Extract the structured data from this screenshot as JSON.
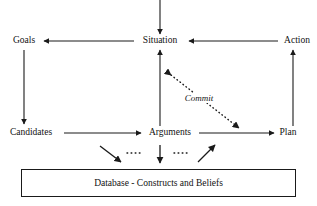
{
  "diagram": {
    "background_color": "#ffffff",
    "line_color": "#1a1a1a",
    "text_color": "#111111",
    "nodes": [
      {
        "id": "goals",
        "label": "Goals",
        "x": 24,
        "y": 41
      },
      {
        "id": "situation",
        "label": "Situation",
        "x": 160,
        "y": 41
      },
      {
        "id": "action",
        "label": "Action",
        "x": 297,
        "y": 41
      },
      {
        "id": "candidates",
        "label": "Candidates",
        "x": 31,
        "y": 133
      },
      {
        "id": "arguments",
        "label": "Arguments",
        "x": 170,
        "y": 133
      },
      {
        "id": "plan",
        "label": "Plan",
        "x": 288,
        "y": 133
      }
    ],
    "edge_labels": [
      {
        "id": "commit",
        "label": "Commit",
        "x": 199,
        "y": 99
      }
    ],
    "database_box": {
      "label": "Database - Constructs and Beliefs"
    },
    "edges": [
      {
        "id": "input-to-situation",
        "from": "top-edge",
        "to": "situation",
        "style": "solid",
        "arrow": "end"
      },
      {
        "id": "situation-to-goals",
        "from": "situation",
        "to": "goals",
        "style": "solid",
        "arrow": "end"
      },
      {
        "id": "action-to-situation",
        "from": "action",
        "to": "situation",
        "style": "solid",
        "arrow": "end"
      },
      {
        "id": "goals-to-candidates",
        "from": "goals",
        "to": "candidates",
        "style": "solid",
        "arrow": "end"
      },
      {
        "id": "arguments-to-situation",
        "from": "arguments",
        "to": "situation",
        "style": "solid",
        "arrow": "end"
      },
      {
        "id": "plan-to-action",
        "from": "plan",
        "to": "action",
        "style": "solid",
        "arrow": "end"
      },
      {
        "id": "candidates-to-arguments",
        "from": "candidates",
        "to": "arguments",
        "style": "solid",
        "arrow": "end"
      },
      {
        "id": "arguments-to-plan",
        "from": "arguments",
        "to": "plan",
        "style": "solid",
        "arrow": "end"
      },
      {
        "id": "commit-link",
        "from": "situation",
        "to": "plan",
        "style": "dotted",
        "arrow": "both"
      },
      {
        "id": "db-left-down",
        "from": "arguments",
        "to": "database",
        "style": "solid",
        "arrow": "end"
      },
      {
        "id": "db-center-down",
        "from": "arguments",
        "to": "database",
        "style": "solid",
        "arrow": "end"
      },
      {
        "id": "db-right-up",
        "from": "database",
        "to": "arguments",
        "style": "solid",
        "arrow": "end"
      }
    ],
    "dot_runs": [
      {
        "id": "dots-left",
        "x1": 127,
        "x2": 142,
        "y": 153
      },
      {
        "id": "dots-right",
        "x1": 174,
        "x2": 189,
        "y": 153
      }
    ]
  }
}
